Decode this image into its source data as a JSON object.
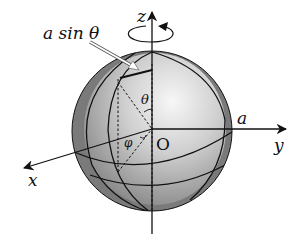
{
  "diagram": {
    "labels": {
      "z_axis": "z",
      "y_axis": "y",
      "x_axis": "x",
      "origin": "O",
      "radius": "a",
      "theta": "θ",
      "phi": "φ",
      "annotation": "a sin θ"
    },
    "colors": {
      "shell": "#7a7a7a",
      "sphere_light": "#f4f4f4",
      "sphere_dark": "#8c8c8c",
      "lines": "#111111",
      "annotation_arrow": "#ffffff"
    },
    "elements": [
      "sphere with darker outer shell",
      "z-axis with rotation arrow",
      "y-axis",
      "x-axis",
      "latitude circle",
      "equator",
      "meridians",
      "dashed projection lines",
      "polar angle theta",
      "azimuthal angle phi",
      "a sin theta radius marker"
    ]
  }
}
